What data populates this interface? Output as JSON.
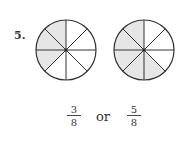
{
  "problem": {
    "number_label": "5.",
    "shade_color": "#e6e6e6",
    "line_color": "#333333",
    "circles": [
      {
        "name": "circle-three-eighths",
        "parts": 8,
        "shaded_count": 3
      },
      {
        "name": "circle-five-eighths",
        "parts": 8,
        "shaded_count": 5
      }
    ],
    "answer": {
      "fraction1": {
        "numerator": "3",
        "denominator": "8"
      },
      "connector": "or",
      "fraction2": {
        "numerator": "5",
        "denominator": "8"
      }
    }
  }
}
